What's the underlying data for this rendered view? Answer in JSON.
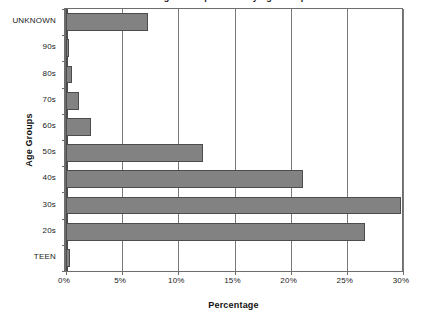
{
  "chart_data": {
    "type": "bar",
    "orientation": "horizontal",
    "title": "",
    "xlabel": "Percentage",
    "ylabel": "Age Groups",
    "categories": [
      "UNKNOWN",
      "90s",
      "80s",
      "70s",
      "60s",
      "50s",
      "40s",
      "30s",
      "20s",
      "TEEN"
    ],
    "values": [
      7.3,
      0.3,
      0.5,
      1.2,
      2.2,
      12.2,
      21.1,
      29.8,
      26.6,
      0.4
    ],
    "xlim": [
      0,
      30
    ],
    "xtick_labels": [
      "0%",
      "5%",
      "10%",
      "15%",
      "20%",
      "25%",
      "30%"
    ],
    "xtick_values": [
      0,
      5,
      10,
      15,
      20,
      25,
      30
    ],
    "grid": "vertical",
    "legend": "none",
    "bar_color": "#828282",
    "bar_border_color": "#4c4c4c",
    "plot_background": "#ffffff",
    "gridline_color": "#7b7b7b",
    "axis_color": "#4a4a4a"
  },
  "axis_titles": {
    "y": "Age Groups",
    "x": "Percentage"
  },
  "title_remnant": "Percentage of Respondents by Age Group"
}
